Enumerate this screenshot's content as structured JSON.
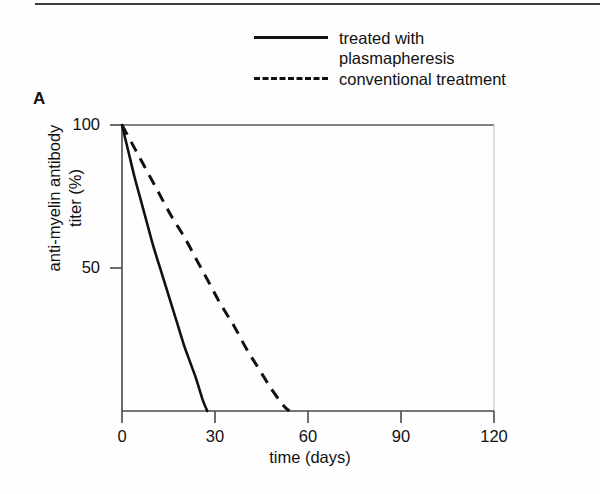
{
  "figure": {
    "panel_letter": "A"
  },
  "legend": {
    "position": "top-right",
    "entries": [
      {
        "style": "solid",
        "label": "treated with\nplasmapheresis",
        "icon": "solid-line-icon"
      },
      {
        "style": "dashed",
        "label": "conventional treatment",
        "icon": "dashed-line-icon"
      }
    ]
  },
  "chart_data": {
    "type": "line",
    "title": "",
    "xlabel": "time (days)",
    "ylabel": "anti-myelin antibody\ntiter (%)",
    "xlim": [
      0,
      120
    ],
    "ylim": [
      0,
      100
    ],
    "xticks": [
      0,
      30,
      60,
      90,
      120
    ],
    "xtick_labels": [
      "0",
      "30",
      "60",
      "90",
      "120"
    ],
    "yticks": [
      50,
      100
    ],
    "ytick_labels": [
      "50",
      "100"
    ],
    "grid": false,
    "legend_position": "top-right",
    "series": [
      {
        "name": "treated with plasmapheresis",
        "style": "solid",
        "color": "#111111",
        "x": [
          0,
          2,
          4,
          6,
          8,
          10,
          12,
          14,
          16,
          18,
          20,
          22,
          24,
          26,
          27.5
        ],
        "values": [
          100,
          91,
          82,
          74,
          66,
          58,
          51,
          44,
          37,
          30,
          23,
          17,
          11,
          4,
          0
        ]
      },
      {
        "name": "conventional treatment",
        "style": "dashed",
        "color": "#111111",
        "x": [
          0,
          4,
          8,
          12,
          16,
          20,
          24,
          28,
          32,
          36,
          40,
          44,
          48,
          52,
          54
        ],
        "values": [
          100,
          92,
          84,
          76,
          68,
          61,
          53,
          45,
          37,
          30,
          22,
          15,
          8,
          2,
          0
        ]
      }
    ]
  },
  "axis_geometry": {
    "plot_left_px": 122,
    "plot_right_px": 494,
    "plot_top_px": 125,
    "plot_bottom_px": 411
  }
}
